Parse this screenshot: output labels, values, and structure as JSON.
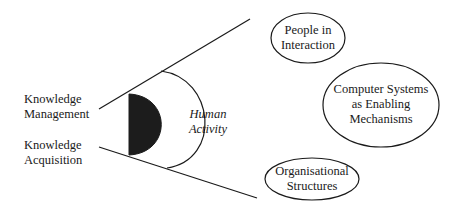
{
  "diagram": {
    "left_labels": {
      "knowledge_management": [
        "Knowledge",
        "Management"
      ],
      "knowledge_acquisition": [
        "Knowledge",
        "Acquisition"
      ]
    },
    "center_label": [
      "Human",
      "Activity"
    ],
    "ellipses": {
      "people": [
        "People in",
        "Interaction"
      ],
      "computer": [
        "Computer Systems",
        "as Enabling",
        "Mechanisms"
      ],
      "organisation": [
        "Organisational",
        "Structures"
      ]
    },
    "colors": {
      "line": "#1a1a1a",
      "fill_dark": "#1c1c1c",
      "background": "#ffffff"
    }
  }
}
